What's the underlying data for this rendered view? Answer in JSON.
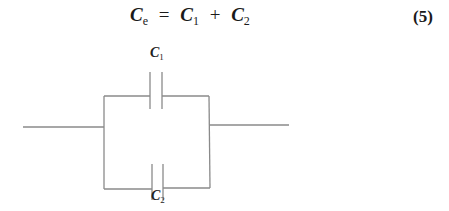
{
  "equation": {
    "lhs_symbol": "C",
    "lhs_sub": "e",
    "equals": "=",
    "term1_symbol": "C",
    "term1_sub": "1",
    "plus": "+",
    "term2_symbol": "C",
    "term2_sub": "2",
    "number": "(5)"
  },
  "diagram": {
    "type": "parallel capacitors circuit",
    "capacitors": [
      {
        "label_symbol": "C",
        "label_sub": "1",
        "branch": "top"
      },
      {
        "label_symbol": "C",
        "label_sub": "2",
        "branch": "bottom"
      }
    ],
    "wire_color": "#8a8a8a"
  }
}
